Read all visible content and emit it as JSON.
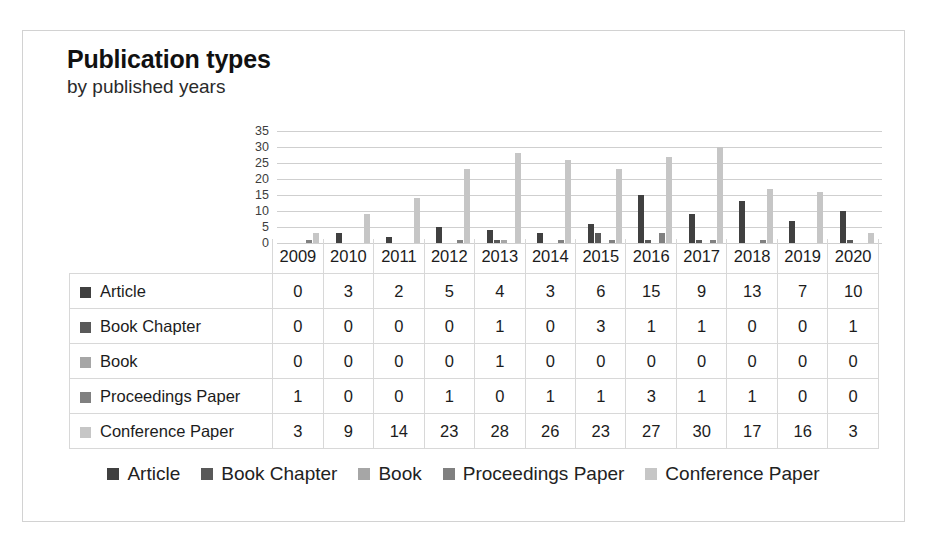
{
  "chart_data": {
    "type": "bar",
    "title": "Publication types",
    "subtitle": "by published years",
    "xlabel": "",
    "ylabel": "",
    "ylim": [
      0,
      35
    ],
    "yticks": [
      35,
      30,
      25,
      20,
      15,
      10,
      5,
      0
    ],
    "grid": true,
    "legend_position": "bottom",
    "categories": [
      "2009",
      "2010",
      "2011",
      "2012",
      "2013",
      "2014",
      "2015",
      "2016",
      "2017",
      "2018",
      "2019",
      "2020"
    ],
    "series": [
      {
        "name": "Article",
        "color": "#404040",
        "values": [
          0,
          3,
          2,
          5,
          4,
          3,
          6,
          15,
          9,
          13,
          7,
          10
        ]
      },
      {
        "name": "Book Chapter",
        "color": "#595959",
        "values": [
          0,
          0,
          0,
          0,
          1,
          0,
          3,
          1,
          1,
          0,
          0,
          1
        ]
      },
      {
        "name": "Book",
        "color": "#a6a6a6",
        "values": [
          0,
          0,
          0,
          0,
          1,
          0,
          0,
          0,
          0,
          0,
          0,
          0
        ]
      },
      {
        "name": "Proceedings Paper",
        "color": "#808080",
        "values": [
          1,
          0,
          0,
          1,
          0,
          1,
          1,
          3,
          1,
          1,
          0,
          0
        ]
      },
      {
        "name": "Conference Paper",
        "color": "#c6c6c6",
        "values": [
          3,
          9,
          14,
          23,
          28,
          26,
          23,
          27,
          30,
          17,
          16,
          3
        ]
      }
    ]
  },
  "table": {
    "years": [
      "2009",
      "2010",
      "2011",
      "2012",
      "2013",
      "2014",
      "2015",
      "2016",
      "2017",
      "2018",
      "2019",
      "2020"
    ],
    "rows": [
      {
        "label": "Article",
        "color": "#404040",
        "values": [
          "0",
          "3",
          "2",
          "5",
          "4",
          "3",
          "6",
          "15",
          "9",
          "13",
          "7",
          "10"
        ]
      },
      {
        "label": "Book Chapter",
        "color": "#595959",
        "values": [
          "0",
          "0",
          "0",
          "0",
          "1",
          "0",
          "3",
          "1",
          "1",
          "0",
          "0",
          "1"
        ]
      },
      {
        "label": "Book",
        "color": "#a6a6a6",
        "values": [
          "0",
          "0",
          "0",
          "0",
          "1",
          "0",
          "0",
          "0",
          "0",
          "0",
          "0",
          "0"
        ]
      },
      {
        "label": "Proceedings Paper",
        "color": "#808080",
        "values": [
          "1",
          "0",
          "0",
          "1",
          "0",
          "1",
          "1",
          "3",
          "1",
          "1",
          "0",
          "0"
        ]
      },
      {
        "label": "Conference Paper",
        "color": "#c6c6c6",
        "values": [
          "3",
          "9",
          "14",
          "23",
          "28",
          "26",
          "23",
          "27",
          "30",
          "17",
          "16",
          "3"
        ]
      }
    ]
  },
  "legend": [
    {
      "label": "Article",
      "color": "#404040"
    },
    {
      "label": "Book Chapter",
      "color": "#595959"
    },
    {
      "label": "Book",
      "color": "#a6a6a6"
    },
    {
      "label": "Proceedings Paper",
      "color": "#808080"
    },
    {
      "label": "Conference Paper",
      "color": "#c6c6c6"
    }
  ]
}
